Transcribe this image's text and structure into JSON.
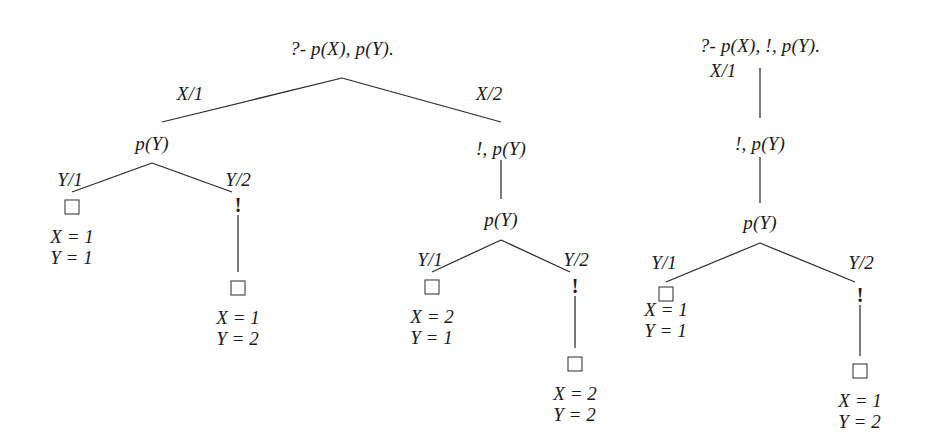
{
  "figure": {
    "background": "#ffffff",
    "ink_color": "#2b2b2b"
  },
  "trees": [
    {
      "id": "tree-without-cut-in-goal",
      "root": {
        "label": "?- p(X), p(Y)."
      },
      "nodes": [
        {
          "id": "t1-n-left-pY",
          "label": "p(Y)"
        },
        {
          "id": "t1-n-right-cut-pY",
          "label": "!, p(Y)"
        },
        {
          "id": "t1-n-right-pY",
          "label": "p(Y)"
        },
        {
          "id": "t1-n-left-right-cut",
          "label": "!"
        },
        {
          "id": "t1-n-right-right-cut",
          "label": "!"
        }
      ],
      "edge_labels": [
        {
          "id": "t1-e-x1",
          "label": "X/1"
        },
        {
          "id": "t1-e-x2",
          "label": "X/2"
        },
        {
          "id": "t1-e-left-y1",
          "label": "Y/1"
        },
        {
          "id": "t1-e-left-y2",
          "label": "Y/2"
        },
        {
          "id": "t1-e-right-y1",
          "label": "Y/1"
        },
        {
          "id": "t1-e-right-y2",
          "label": "Y/2"
        }
      ],
      "solutions": [
        {
          "id": "t1-s1",
          "x_binding": "X = 1",
          "y_binding": "Y = 1"
        },
        {
          "id": "t1-s2",
          "x_binding": "X = 1",
          "y_binding": "Y = 2"
        },
        {
          "id": "t1-s3",
          "x_binding": "X = 2",
          "y_binding": "Y = 1"
        },
        {
          "id": "t1-s4",
          "x_binding": "X = 2",
          "y_binding": "Y = 2"
        }
      ]
    },
    {
      "id": "tree-with-cut-in-goal",
      "root": {
        "label": "?- p(X), !, p(Y)."
      },
      "nodes": [
        {
          "id": "t2-n-cut-pY",
          "label": "!, p(Y)"
        },
        {
          "id": "t2-n-pY",
          "label": "p(Y)"
        },
        {
          "id": "t2-n-right-cut",
          "label": "!"
        }
      ],
      "edge_labels": [
        {
          "id": "t2-e-x1",
          "label": "X/1"
        },
        {
          "id": "t2-e-y1",
          "label": "Y/1"
        },
        {
          "id": "t2-e-y2",
          "label": "Y/2"
        }
      ],
      "solutions": [
        {
          "id": "t2-s1",
          "x_binding": "X = 1",
          "y_binding": "Y = 1"
        },
        {
          "id": "t2-s2",
          "x_binding": "X = 1",
          "y_binding": "Y = 2"
        }
      ]
    }
  ]
}
